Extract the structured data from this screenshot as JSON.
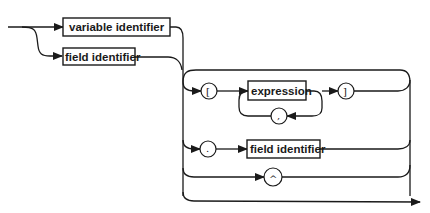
{
  "diagram": {
    "type": "syntax-diagram",
    "nodes": {
      "variable_identifier": "variable identifier",
      "field_identifier_1": "field identifier",
      "expression": "expression",
      "field_identifier_2": "field identifier"
    },
    "terminals": {
      "open_bracket": "[",
      "close_bracket": "]",
      "comma": ",",
      "period": ".",
      "caret": "^"
    },
    "colors": {
      "stroke": "#1a1a1a",
      "background": "#ffffff"
    }
  }
}
